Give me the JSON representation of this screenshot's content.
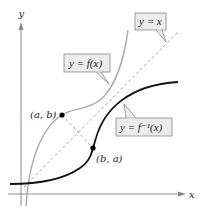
{
  "diagram": {
    "axes": {
      "x_label": "x",
      "y_label": "y"
    },
    "curves": {
      "f": {
        "label": "y = f(x)",
        "color": "#a8a8a8"
      },
      "f_inverse": {
        "label": "y = f⁻¹(x)",
        "color": "#111111"
      },
      "identity": {
        "label": "y = x",
        "color": "#999999"
      }
    },
    "points": {
      "ab": {
        "label": "(a, b)"
      },
      "ba": {
        "label": "(b, a)"
      }
    },
    "colors": {
      "axis": "#8a8a8a",
      "callout_fill": "#ececec",
      "callout_stroke": "#888888",
      "point": "#000000"
    }
  }
}
